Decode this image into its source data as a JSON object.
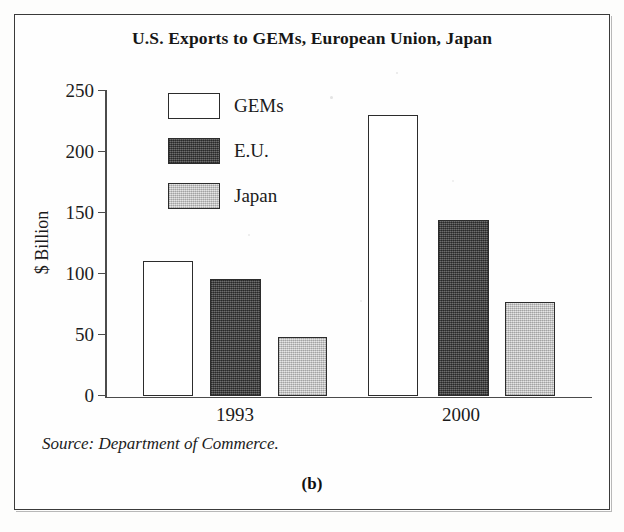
{
  "figure": {
    "title": "U.S. Exports to GEMs, European Union, Japan",
    "panel_label": "(b)",
    "source_note": "Source: Department of Commerce."
  },
  "axes": {
    "y_title": "$ Billion",
    "y_ticks": [
      "250",
      "200",
      "150",
      "100",
      "50",
      "0"
    ],
    "x_ticks": [
      "1993",
      "2000"
    ]
  },
  "legend": {
    "items": [
      {
        "label": "GEMs",
        "style": "white",
        "color": "#ffffff"
      },
      {
        "label": "E.U.",
        "style": "dark",
        "color": "#4e4e4e"
      },
      {
        "label": "Japan",
        "style": "light",
        "color": "#d2d2d2"
      }
    ]
  },
  "chart_data": {
    "type": "bar",
    "title": "U.S. Exports to GEMs, European Union, Japan",
    "xlabel": "",
    "ylabel": "$ Billion",
    "ylim": [
      0,
      250
    ],
    "ytick_interval": 50,
    "grid": false,
    "legend_position": "upper-left-inside",
    "categories": [
      "1993",
      "2000"
    ],
    "series": [
      {
        "name": "GEMs",
        "values": [
          111,
          230
        ],
        "color": "#ffffff"
      },
      {
        "name": "E.U.",
        "values": [
          96,
          144
        ],
        "color": "#4e4e4e"
      },
      {
        "name": "Japan",
        "values": [
          48,
          77
        ],
        "color": "#d2d2d2"
      }
    ],
    "source": "Department of Commerce."
  }
}
